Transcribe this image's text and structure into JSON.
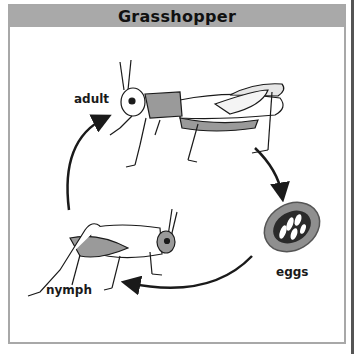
{
  "diagram": {
    "title": "Grasshopper",
    "type": "life-cycle",
    "stages": [
      {
        "id": "adult",
        "label": "adult"
      },
      {
        "id": "eggs",
        "label": "eggs"
      },
      {
        "id": "nymph",
        "label": "nymph"
      }
    ],
    "cycle_order": [
      "adult",
      "eggs",
      "nymph",
      "adult"
    ],
    "colors": {
      "title_bar": "#a9a9a9",
      "frame_border": "#a8a8a8",
      "insect_shading": "#9a9a9a",
      "egg_pod": "#8f8f8f",
      "ink": "#1a1a1a"
    }
  }
}
